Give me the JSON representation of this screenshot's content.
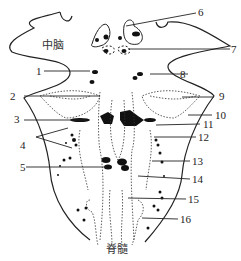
{
  "regions": {
    "midbrain_label": "中脑",
    "spinal_cord_label": "脊髓"
  },
  "numbers": [
    {
      "id": "1",
      "text": "1"
    },
    {
      "id": "2",
      "text": "2"
    },
    {
      "id": "3",
      "text": "3"
    },
    {
      "id": "4",
      "text": "4"
    },
    {
      "id": "5",
      "text": "5"
    },
    {
      "id": "6",
      "text": "6"
    },
    {
      "id": "7",
      "text": "7"
    },
    {
      "id": "8",
      "text": "8"
    },
    {
      "id": "9",
      "text": "9"
    },
    {
      "id": "10",
      "text": "10"
    },
    {
      "id": "11",
      "text": "11"
    },
    {
      "id": "12",
      "text": "12"
    },
    {
      "id": "13",
      "text": "13"
    },
    {
      "id": "14",
      "text": "14"
    },
    {
      "id": "15",
      "text": "15"
    },
    {
      "id": "16",
      "text": "16"
    }
  ],
  "colors": {
    "line": "#222222",
    "fill": "#111111",
    "background": "#ffffff"
  }
}
